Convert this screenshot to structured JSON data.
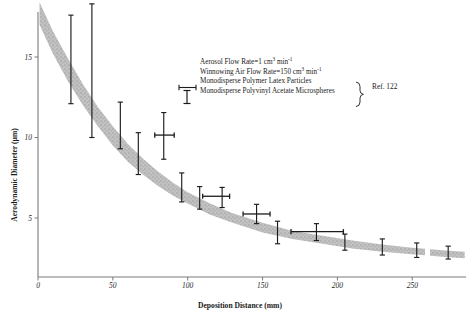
{
  "chart_data": {
    "type": "scatter",
    "title": "",
    "xlabel": "Deposition Distance (mm)",
    "ylabel": "Aerodynamic Diameter (µm)",
    "xlim": [
      0,
      285
    ],
    "ylim": [
      0,
      18.5
    ],
    "xticks": [
      0,
      50,
      100,
      150,
      200,
      250
    ],
    "xticklabels": [
      "0",
      "50",
      "100",
      "150",
      "200",
      "250"
    ],
    "yticks": [
      5,
      10,
      15
    ],
    "yticklabels": [
      "5",
      "10",
      "15"
    ],
    "grid": false,
    "legend_position": "upper-center-right",
    "band": {
      "name": "shaded correlation band",
      "color": "#b5b5b5",
      "upper": [
        [
          1,
          18.4
        ],
        [
          10,
          16.6
        ],
        [
          20,
          14.9
        ],
        [
          30,
          13.3
        ],
        [
          40,
          11.9
        ],
        [
          50,
          10.7
        ],
        [
          60,
          9.6
        ],
        [
          70,
          8.7
        ],
        [
          80,
          7.9
        ],
        [
          90,
          7.2
        ],
        [
          100,
          6.6
        ],
        [
          115,
          5.9
        ],
        [
          130,
          5.3
        ],
        [
          150,
          4.7
        ],
        [
          170,
          4.2
        ],
        [
          190,
          3.9
        ],
        [
          210,
          3.6
        ],
        [
          230,
          3.35
        ],
        [
          250,
          3.15
        ],
        [
          270,
          3.0
        ],
        [
          285,
          2.9
        ]
      ],
      "lower": [
        [
          1,
          17.0
        ],
        [
          10,
          15.2
        ],
        [
          20,
          13.5
        ],
        [
          30,
          12.0
        ],
        [
          40,
          10.7
        ],
        [
          50,
          9.5
        ],
        [
          60,
          8.5
        ],
        [
          70,
          7.7
        ],
        [
          80,
          7.0
        ],
        [
          90,
          6.4
        ],
        [
          100,
          5.9
        ],
        [
          115,
          5.2
        ],
        [
          130,
          4.7
        ],
        [
          150,
          4.1
        ],
        [
          170,
          3.7
        ],
        [
          190,
          3.4
        ],
        [
          210,
          3.1
        ],
        [
          230,
          2.9
        ],
        [
          250,
          2.75
        ],
        [
          270,
          2.6
        ],
        [
          285,
          2.5
        ]
      ]
    },
    "series": [
      {
        "name": "Monodisperse Polymer Latex Particles",
        "marker": "horizontal-error-bar",
        "points": [
          {
            "x": 84,
            "y": 10.15,
            "xerr_low": 6,
            "xerr_high": 7
          },
          {
            "x": 123,
            "y": 6.35,
            "xerr_low": 13,
            "xerr_high": 5
          },
          {
            "x": 146,
            "y": 5.25,
            "xerr_low": 9,
            "xerr_high": 9
          },
          {
            "x": 186,
            "y": 4.15,
            "xerr_low": 17,
            "xerr_high": 18
          }
        ]
      },
      {
        "name": "Monodisperse Polyvinyl Acetate Microspheres",
        "marker": "vertical-error-bar",
        "points": [
          {
            "x": 22,
            "y": 15.6,
            "yerr_low": 3.5,
            "yerr_high": 2.0
          },
          {
            "x": 36,
            "y": 14.0,
            "yerr_low": 4.0,
            "yerr_high": 4.3
          },
          {
            "x": 55,
            "y": 10.6,
            "yerr_low": 1.3,
            "yerr_high": 1.6
          },
          {
            "x": 67,
            "y": 9.0,
            "yerr_low": 1.3,
            "yerr_high": 1.3
          },
          {
            "x": 84,
            "y": 10.15,
            "yerr_low": 1.5,
            "yerr_high": 1.4
          },
          {
            "x": 96,
            "y": 6.9,
            "yerr_low": 0.9,
            "yerr_high": 0.9
          },
          {
            "x": 108,
            "y": 6.25,
            "yerr_low": 0.7,
            "yerr_high": 0.7
          },
          {
            "x": 123,
            "y": 6.35,
            "yerr_low": 0.7,
            "yerr_high": 0.55
          },
          {
            "x": 146,
            "y": 5.25,
            "yerr_low": 0.6,
            "yerr_high": 0.6
          },
          {
            "x": 160,
            "y": 4.1,
            "yerr_low": 0.7,
            "yerr_high": 0.7
          },
          {
            "x": 186,
            "y": 4.15,
            "yerr_low": 0.55,
            "yerr_high": 0.5
          },
          {
            "x": 205,
            "y": 3.5,
            "yerr_low": 0.5,
            "yerr_high": 0.5
          },
          {
            "x": 230,
            "y": 3.2,
            "yerr_low": 0.5,
            "yerr_high": 0.5
          },
          {
            "x": 253,
            "y": 3.0,
            "yerr_low": 0.45,
            "yerr_high": 0.45
          },
          {
            "x": 274,
            "y": 2.85,
            "yerr_low": 0.4,
            "yerr_high": 0.4
          }
        ]
      }
    ],
    "annotations": [
      "Aerosol Flow Rate=1 cm3 min-1",
      "Winnowing Air Flow Rate=150 cm3 min-1",
      "Ref. 122"
    ]
  },
  "legend": {
    "line1_pre": "Aerosol Flow Rate=1 cm",
    "line1_sup1": "3",
    "line1_mid": " min",
    "line1_sup2": "-1",
    "line2_pre": "Winnowing Air Flow Rate=150 cm",
    "line2_sup1": "3",
    "line2_mid": " min",
    "line2_sup2": "-1",
    "line3": "Monodisperse Polymer Latex Particles",
    "line4": "Monodisperse Polyvinyl Acetate Microspheres",
    "reference": "Ref. 122"
  },
  "colors": {
    "band": "#b5b5b5",
    "marker": "#1c1c1c",
    "axis": "#6e6e6e",
    "text": "#1a1a1a",
    "background": "#ffffff"
  }
}
